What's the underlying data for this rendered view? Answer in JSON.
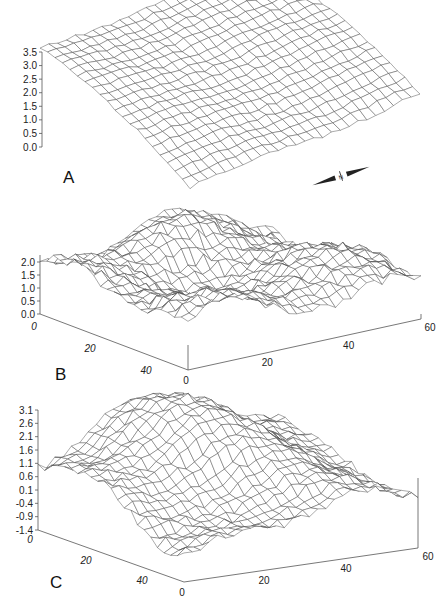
{
  "figure": {
    "panels": [
      {
        "id": "A",
        "label": "A"
      },
      {
        "id": "B",
        "label": "B"
      },
      {
        "id": "C",
        "label": "C"
      }
    ]
  },
  "compass": {
    "icon": "north-arrow-icon",
    "label": "N"
  },
  "chart_data": [
    {
      "type": "surface",
      "panel": "A",
      "title": "",
      "z_ticks": [
        "0.0",
        "0.5",
        "1.0",
        "1.5",
        "2.0",
        "2.5",
        "3.0",
        "3.5"
      ],
      "zlim": [
        0.0,
        3.5
      ],
      "x_ticks": [],
      "y_ticks": [],
      "description": "Smooth dome-like wireframe surface, high (~2.5-3.5) toward back/left, sloping down toward front",
      "grid": true
    },
    {
      "type": "surface",
      "panel": "B",
      "title": "",
      "z_ticks": [
        "0.0",
        "0.5",
        "1.0",
        "1.5",
        "2.0"
      ],
      "zlim": [
        0.0,
        2.0
      ],
      "x_ticks": [
        "0",
        "20",
        "40",
        "60"
      ],
      "y_ticks": [
        "0",
        "20",
        "40"
      ],
      "xlim": [
        0,
        60
      ],
      "ylim": [
        0,
        50
      ],
      "description": "Rough wireframe surface with ridges; peak near back center (~2.0), valleys toward front",
      "grid": true
    },
    {
      "type": "surface",
      "panel": "C",
      "title": "",
      "z_ticks": [
        "-1.4",
        "-0.9",
        "-0.4",
        "0.1",
        "0.6",
        "1.1",
        "1.6",
        "2.1",
        "2.6",
        "3.1"
      ],
      "zlim": [
        -1.4,
        3.1
      ],
      "x_ticks": [
        "0",
        "20",
        "40",
        "60"
      ],
      "y_ticks": [
        "0",
        "20",
        "40"
      ],
      "xlim": [
        0,
        60
      ],
      "ylim": [
        0,
        50
      ],
      "description": "Wireframe surface with raised central plateau (~2.6-3.1) dropping to low values at front-left",
      "grid": true
    }
  ]
}
